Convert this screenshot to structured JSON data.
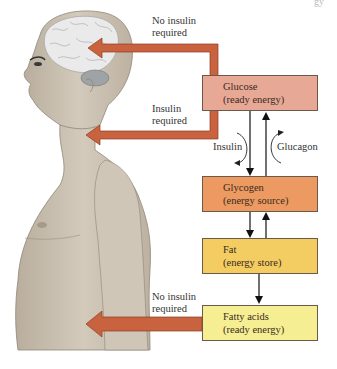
{
  "corner_fragment": "gy",
  "labels": {
    "brain": [
      "No insulin",
      "required"
    ],
    "body_upper": [
      "Insulin",
      "required"
    ],
    "muscle": [
      "No insulin",
      "required"
    ],
    "insulin": "Insulin",
    "glucagon": "Glucagon"
  },
  "boxes": [
    {
      "id": "glucose",
      "title": "Glucose",
      "subtitle": "(ready energy)",
      "color": "#e8a896"
    },
    {
      "id": "glycogen",
      "title": "Glycogen",
      "subtitle": "(energy source)",
      "color": "#ec9a62"
    },
    {
      "id": "fat",
      "title": "Fat",
      "subtitle": "(energy store)",
      "color": "#f3cd62"
    },
    {
      "id": "fatty_acids",
      "title": "Fatty acids",
      "subtitle": "(ready energy)",
      "color": "#f6ee92"
    }
  ],
  "colors": {
    "arrow": "#c8623f",
    "arrow_outline": "#8a3e22",
    "skin": "#c9bfb0",
    "brain": "#e8e8e8"
  }
}
